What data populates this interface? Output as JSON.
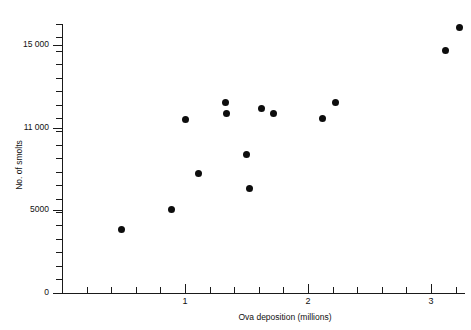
{
  "chart_data": {
    "type": "scatter",
    "title": "",
    "xlabel": "Ova deposition (millions)",
    "ylabel": "No. of smolts",
    "xlim": [
      0,
      3.27
    ],
    "ylim": [
      0,
      16500
    ],
    "grid": false,
    "legend": null,
    "x_ticklabels": [
      "1",
      "2",
      "3"
    ],
    "x_ticks": [
      1,
      2,
      3
    ],
    "y_ticklabels": [
      "0",
      "5000",
      "11 000",
      "15 000"
    ],
    "y_ticks": [
      0,
      5000,
      11000,
      15000
    ],
    "marker": "filled-circle",
    "marker_color": "#0d0d0d",
    "points": [
      {
        "x": 0.48,
        "y": 3900
      },
      {
        "x": 0.89,
        "y": 5100
      },
      {
        "x": 1.0,
        "y": 10650
      },
      {
        "x": 1.11,
        "y": 7300
      },
      {
        "x": 1.33,
        "y": 11700
      },
      {
        "x": 1.34,
        "y": 11000
      },
      {
        "x": 1.5,
        "y": 8500
      },
      {
        "x": 1.52,
        "y": 6400
      },
      {
        "x": 1.62,
        "y": 11300
      },
      {
        "x": 1.72,
        "y": 11000
      },
      {
        "x": 2.12,
        "y": 10700
      },
      {
        "x": 2.22,
        "y": 11700
      },
      {
        "x": 3.12,
        "y": 14850
      },
      {
        "x": 3.23,
        "y": 16300
      }
    ],
    "_px": {
      "x0": 62,
      "x_per_unit": 123.0,
      "y0": 292.5,
      "y_top_val": 16500,
      "y_top_px": 24
    }
  },
  "axes": {
    "y_minor_tick_count": 20,
    "x_minor_tick_count": 16
  }
}
